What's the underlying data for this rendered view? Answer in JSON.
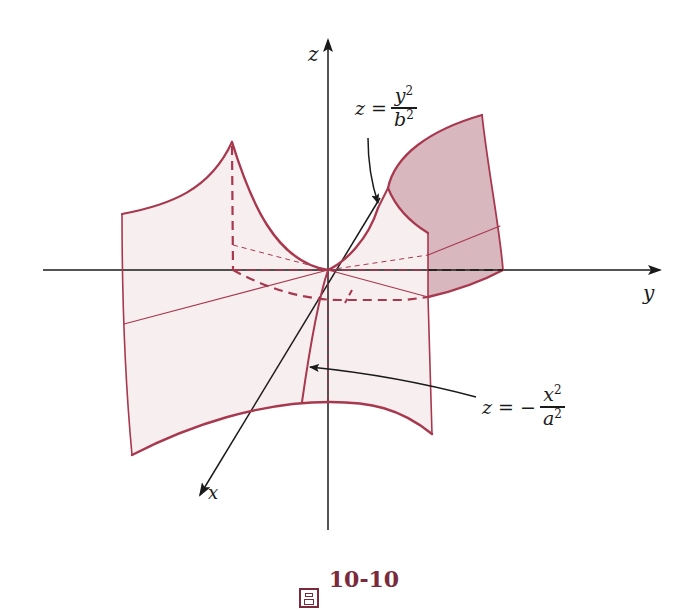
{
  "figure": {
    "caption_prefix": "圖",
    "caption_number": "10-10",
    "colors": {
      "surface_stroke": "#a8384e",
      "surface_fill": "#f7eef0",
      "shaded_fill": "#d9b7bf",
      "axis": "#1a1a1a",
      "caption": "#7a2a3a"
    }
  },
  "axes": {
    "x_label": "x",
    "y_label": "y",
    "z_label": "z"
  },
  "annotations": {
    "upper": {
      "lhs": "z =",
      "num": "y",
      "num_exp": "2",
      "den": "b",
      "den_exp": "2"
    },
    "lower": {
      "lhs": "z = −",
      "num": "x",
      "num_exp": "2",
      "den": "a",
      "den_exp": "2"
    }
  }
}
